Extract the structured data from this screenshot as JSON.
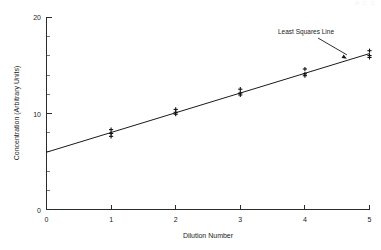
{
  "figure": {
    "top_clipped_text": "A  C  3",
    "background_color": "#ffffff",
    "ink_color": "#1a1a1a"
  },
  "chart_data": {
    "type": "scatter",
    "title": "",
    "xlabel": "Dilution Number",
    "ylabel": "Concentration (Arbitrary Units)",
    "xlim": [
      0,
      5
    ],
    "ylim": [
      0,
      20
    ],
    "xticks": [
      0,
      1,
      2,
      3,
      4,
      5
    ],
    "xtick_labels": [
      "0",
      "1",
      "2",
      "3",
      "4",
      "5"
    ],
    "yticks": [
      0,
      10,
      20
    ],
    "ytick_labels": [
      "0",
      "10",
      "20"
    ],
    "y_minor_ticks": [
      2,
      4,
      6,
      8,
      12,
      14,
      16,
      18
    ],
    "grid": false,
    "legend": false,
    "series": [
      {
        "name": "Measured concentration",
        "marker": "plus",
        "x": [
          1,
          1,
          1,
          2,
          2,
          2,
          3,
          3,
          3,
          4,
          4,
          4,
          5,
          5,
          5
        ],
        "y": [
          8.3,
          7.9,
          7.6,
          10.4,
          10.1,
          9.9,
          12.5,
          12.1,
          11.9,
          14.6,
          14.1,
          13.9,
          16.5,
          16.0,
          15.8
        ]
      }
    ],
    "fit": {
      "name": "Least Squares Line",
      "type": "linear",
      "intercept": 5.95,
      "slope": 2.05,
      "x_start": 0,
      "x_end": 5,
      "y_start": 5.95,
      "y_end": 16.2
    },
    "annotations": [
      {
        "label": "Least Squares Line",
        "text_x": 3.5,
        "text_y": 18.6,
        "target_x": 4.65,
        "target_y": 15.5
      }
    ]
  }
}
